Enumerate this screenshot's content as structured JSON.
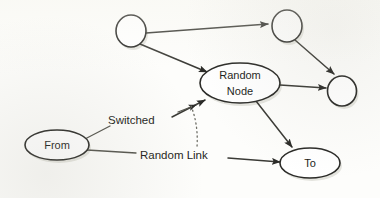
{
  "diagram": {
    "background_color": "#fdfdfb",
    "stroke_color": "#2b2b28",
    "node_fill_color": "#ffffff",
    "nodes": [
      {
        "id": "circle-top-left",
        "label": "",
        "shape": "circle",
        "cx": 131,
        "cy": 31,
        "rx": 15,
        "ry": 16
      },
      {
        "id": "circle-top-right",
        "label": "",
        "shape": "circle",
        "cx": 287,
        "cy": 26,
        "rx": 15,
        "ry": 16
      },
      {
        "id": "circle-right",
        "label": "",
        "shape": "circle",
        "cx": 342,
        "cy": 91,
        "rx": 14.5,
        "ry": 15
      },
      {
        "id": "random-node",
        "label": "Random Node",
        "label_line1": "Random",
        "label_line2": "Node",
        "shape": "ellipse",
        "cx": 240,
        "cy": 83,
        "rx": 40,
        "ry": 20
      },
      {
        "id": "from-node",
        "label": "From",
        "shape": "ellipse",
        "cx": 57,
        "cy": 145,
        "rx": 32,
        "ry": 15
      },
      {
        "id": "to-node",
        "label": "To",
        "shape": "ellipse",
        "cx": 310,
        "cy": 163,
        "rx": 30,
        "ry": 15
      }
    ],
    "edges": [
      {
        "id": "edge-topleft-to-topright",
        "from": "circle-top-left",
        "to": "circle-top-right",
        "style": "solid",
        "arrow": true
      },
      {
        "id": "edge-topleft-to-randomnode",
        "from": "circle-top-left",
        "to": "random-node",
        "style": "solid",
        "arrow": true
      },
      {
        "id": "edge-topright-to-right",
        "from": "circle-top-right",
        "to": "circle-right",
        "style": "solid",
        "arrow": true
      },
      {
        "id": "edge-randomnode-to-right",
        "from": "random-node",
        "to": "circle-right",
        "style": "solid",
        "arrow": true
      },
      {
        "id": "edge-randomnode-to-to",
        "from": "random-node",
        "to": "to-node",
        "style": "solid",
        "arrow": true
      },
      {
        "id": "edge-switched-to-randomnode",
        "from": "from-node",
        "to": "random-node",
        "style": "solid",
        "arrow": true,
        "label": "Switched"
      },
      {
        "id": "edge-randomlink-to-to",
        "from": "from-node",
        "to": "to-node",
        "style": "solid",
        "arrow": true,
        "label": "Random Link"
      },
      {
        "id": "edge-annotation-dotted",
        "from": "random-node",
        "to": "edge-randomlink-to-to",
        "style": "dotted",
        "arrow": false
      }
    ],
    "labels": {
      "switched": "Switched",
      "random_link": "Random Link",
      "random_node_line1": "Random",
      "random_node_line2": "Node",
      "from": "From",
      "to": "To"
    }
  }
}
